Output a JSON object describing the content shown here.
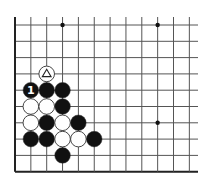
{
  "diagram": {
    "type": "go-board-fragment",
    "grid": {
      "cols": 12,
      "rows": 10,
      "origin_x": 15,
      "origin_y": 25,
      "dx": 15.85,
      "dy": 16.3,
      "visible_right_x": 198,
      "edges": {
        "left": true,
        "bottom": true,
        "top": false,
        "right": false
      },
      "line_color": "#555555",
      "edge_color": "#222222"
    },
    "star_points": [
      {
        "col": 3,
        "row": 0
      },
      {
        "col": 9,
        "row": 0
      },
      {
        "col": 9,
        "row": 6
      }
    ],
    "stones": [
      {
        "col": 2,
        "row": 3,
        "color": "white",
        "mark": "triangle"
      },
      {
        "col": 1,
        "row": 4,
        "color": "black",
        "mark": "1"
      },
      {
        "col": 2,
        "row": 4,
        "color": "black"
      },
      {
        "col": 3,
        "row": 4,
        "color": "black"
      },
      {
        "col": 1,
        "row": 5,
        "color": "white"
      },
      {
        "col": 2,
        "row": 5,
        "color": "white"
      },
      {
        "col": 3,
        "row": 5,
        "color": "black"
      },
      {
        "col": 1,
        "row": 6,
        "color": "white"
      },
      {
        "col": 2,
        "row": 6,
        "color": "black"
      },
      {
        "col": 3,
        "row": 6,
        "color": "white"
      },
      {
        "col": 4,
        "row": 6,
        "color": "black"
      },
      {
        "col": 1,
        "row": 7,
        "color": "black"
      },
      {
        "col": 2,
        "row": 7,
        "color": "black"
      },
      {
        "col": 3,
        "row": 7,
        "color": "white"
      },
      {
        "col": 4,
        "row": 7,
        "color": "white"
      },
      {
        "col": 5,
        "row": 7,
        "color": "black"
      },
      {
        "col": 3,
        "row": 8,
        "color": "black"
      }
    ],
    "colors": {
      "black_stone": "#111111",
      "white_stone": "#ffffff",
      "stone_outline": "#333333"
    }
  }
}
